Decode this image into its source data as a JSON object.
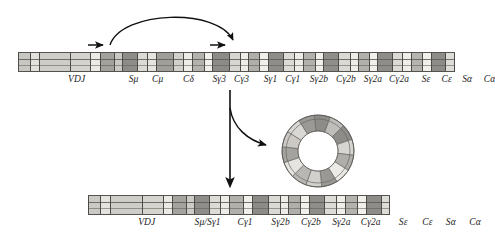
{
  "figure": {
    "background_color": "#ffffff",
    "line_color": "#111111"
  },
  "germline_locus": {
    "name": "germline-heavy-chain-locus",
    "bar": {
      "x": 18,
      "y": 52,
      "width": 437,
      "height": 20
    },
    "segments": [
      {
        "w": 13,
        "shade": "#c9c7c2"
      },
      {
        "w": 9,
        "shade": "#e3e1dc"
      },
      {
        "w": 36,
        "shade": "#cfcdc8"
      },
      {
        "w": 22,
        "shade": "#d5d3ce"
      },
      {
        "w": 10,
        "shade": "#eceae5"
      },
      {
        "w": 16,
        "shade": "#a3a19c"
      },
      {
        "w": 8,
        "shade": "#cbc9c4"
      },
      {
        "w": 16,
        "shade": "#8e8c88"
      },
      {
        "w": 11,
        "shade": "#dcdad5"
      },
      {
        "w": 10,
        "shade": "#e6e4df"
      },
      {
        "w": 18,
        "shade": "#a09e99"
      },
      {
        "w": 11,
        "shade": "#d2d0cb"
      },
      {
        "w": 9,
        "shade": "#eeece7"
      },
      {
        "w": 13,
        "shade": "#b4b2ad"
      },
      {
        "w": 8,
        "shade": "#f2f0eb"
      },
      {
        "w": 19,
        "shade": "#8d8b87"
      },
      {
        "w": 12,
        "shade": "#d8d6d1"
      },
      {
        "w": 8,
        "shade": "#efede8"
      },
      {
        "w": 12,
        "shade": "#b0aea9"
      },
      {
        "w": 9,
        "shade": "#f1efea"
      },
      {
        "w": 17,
        "shade": "#8f8d89"
      },
      {
        "w": 12,
        "shade": "#dddbd6"
      },
      {
        "w": 9,
        "shade": "#eeece7"
      },
      {
        "w": 13,
        "shade": "#b3b1ac"
      },
      {
        "w": 8,
        "shade": "#f1efea"
      },
      {
        "w": 17,
        "shade": "#908e8a"
      },
      {
        "w": 12,
        "shade": "#dbd9d4"
      },
      {
        "w": 9,
        "shade": "#efede8"
      },
      {
        "w": 12,
        "shade": "#b2b0ab"
      },
      {
        "w": 8,
        "shade": "#f2f0eb"
      },
      {
        "w": 16,
        "shade": "#8f8d89"
      },
      {
        "w": 11,
        "shade": "#dcdad5"
      },
      {
        "w": 9,
        "shade": "#f0eee9"
      },
      {
        "w": 12,
        "shade": "#b6b4af"
      },
      {
        "w": 9,
        "shade": "#f2f0eb"
      },
      {
        "w": 16,
        "shade": "#8e8c88"
      },
      {
        "w": 9,
        "shade": "#dedcd7"
      }
    ],
    "labels": [
      {
        "text": "VDJ",
        "x": 63,
        "name": "label-vdj"
      },
      {
        "text": "Sμ",
        "x": 124,
        "name": "label-s-mu"
      },
      {
        "text": "Cμ",
        "x": 150,
        "name": "label-c-mu"
      },
      {
        "text": "Cδ",
        "x": 183,
        "name": "label-c-delta"
      },
      {
        "text": "Sγ3",
        "x": 216,
        "name": "label-s-gamma3"
      },
      {
        "text": "Cγ3",
        "x": 240,
        "name": "label-c-gamma3"
      },
      {
        "text": "Sγ1",
        "x": 271,
        "name": "label-s-gamma1"
      },
      {
        "text": "Cγ1",
        "x": 295,
        "name": "label-c-gamma1"
      },
      {
        "text": "Sγ2b",
        "x": 323,
        "name": "label-s-gamma2b"
      },
      {
        "text": "Cγ2b",
        "x": 352,
        "name": "label-c-gamma2b"
      },
      {
        "text": "Sγ2a",
        "x": 381,
        "name": "label-s-gamma2a"
      },
      {
        "text": "Cγ2a",
        "x": 409,
        "name": "label-c-gamma2a"
      },
      {
        "text": "Sε",
        "x": 438,
        "name": "label-s-epsilon"
      },
      {
        "text": "Cε",
        "x": 460,
        "name": "label-c-epsilon"
      },
      {
        "text": "Sα",
        "x": 482,
        "name": "label-s-alpha"
      },
      {
        "text": "Cα",
        "x": 506,
        "name": "label-c-alpha"
      }
    ]
  },
  "switched_locus": {
    "name": "switched-heavy-chain-locus",
    "bar": {
      "x": 88,
      "y": 195,
      "width": 302,
      "height": 20
    },
    "segments": [
      {
        "w": 12,
        "shade": "#cbc9c4"
      },
      {
        "w": 9,
        "shade": "#e5e3de"
      },
      {
        "w": 34,
        "shade": "#cfcdc8"
      },
      {
        "w": 21,
        "shade": "#d6d4cf"
      },
      {
        "w": 9,
        "shade": "#eceae5"
      },
      {
        "w": 14,
        "shade": "#a5a39e"
      },
      {
        "w": 8,
        "shade": "#cdcbc6"
      },
      {
        "w": 15,
        "shade": "#8f8d89"
      },
      {
        "w": 10,
        "shade": "#dddbd6"
      },
      {
        "w": 9,
        "shade": "#eeece7"
      },
      {
        "w": 14,
        "shade": "#b2b0ab"
      },
      {
        "w": 8,
        "shade": "#f1efea"
      },
      {
        "w": 17,
        "shade": "#8d8b87"
      },
      {
        "w": 11,
        "shade": "#dbd9d4"
      },
      {
        "w": 8,
        "shade": "#efede8"
      },
      {
        "w": 12,
        "shade": "#b1afaa"
      },
      {
        "w": 8,
        "shade": "#f2f0eb"
      },
      {
        "w": 16,
        "shade": "#8f8d89"
      },
      {
        "w": 11,
        "shade": "#dedcd7"
      },
      {
        "w": 9,
        "shade": "#f0eee9"
      },
      {
        "w": 12,
        "shade": "#b5b3ae"
      },
      {
        "w": 8,
        "shade": "#f2f0eb"
      },
      {
        "w": 15,
        "shade": "#8e8c88"
      },
      {
        "w": 8,
        "shade": "#dedcd7"
      }
    ],
    "labels": [
      {
        "text": "VDJ",
        "x": 58,
        "name": "label-sw-vdj"
      },
      {
        "text": "Sμ/Sγ1",
        "x": 118,
        "name": "label-sw-s-mu-s-gamma1"
      },
      {
        "text": "Cγ1",
        "x": 155,
        "name": "label-sw-c-gamma1"
      },
      {
        "text": "Sγ2b",
        "x": 190,
        "name": "label-sw-s-gamma2b"
      },
      {
        "text": "Cγ2b",
        "x": 220,
        "name": "label-sw-c-gamma2b"
      },
      {
        "text": "Sγ2a",
        "x": 250,
        "name": "label-sw-s-gamma2a"
      },
      {
        "text": "Cγ2a",
        "x": 279,
        "name": "label-sw-c-gamma2a"
      },
      {
        "text": "Sε",
        "x": 311,
        "name": "label-sw-s-epsilon"
      },
      {
        "text": "Cε",
        "x": 335,
        "name": "label-sw-c-epsilon"
      },
      {
        "text": "Sα",
        "x": 358,
        "name": "label-sw-s-alpha"
      },
      {
        "text": "Cα",
        "x": 382,
        "name": "label-sw-c-alpha"
      }
    ]
  },
  "switch_circle": {
    "name": "excised-switch-circle",
    "center": {
      "x": 318,
      "y": 151
    },
    "outer_radius": 36,
    "inner_radius": 20,
    "segments": [
      {
        "shade": "#8e8c88"
      },
      {
        "shade": "#c0bebb"
      },
      {
        "shade": "#8e8c88"
      },
      {
        "shade": "#d7d5d1"
      },
      {
        "shade": "#b0aeaa"
      },
      {
        "shade": "#eceae6"
      },
      {
        "shade": "#9a9894"
      },
      {
        "shade": "#d2d0cc"
      },
      {
        "shade": "#b9b7b3"
      },
      {
        "shade": "#e6e4e0"
      },
      {
        "shade": "#a5a39f"
      },
      {
        "shade": "#ccc9c5"
      },
      {
        "shade": "#dad8d4"
      },
      {
        "shade": "#9b9995"
      }
    ]
  },
  "arrows": {
    "recombination_arc": {
      "name": "recombination-arc-arrow",
      "from_x": 110,
      "to_x": 234,
      "apex_y": 16,
      "base_y": 45
    },
    "tick_arrow_left": {
      "name": "switch-region-marker-left",
      "x": 100,
      "y": 45
    },
    "tick_arrow_right": {
      "name": "switch-region-marker-right",
      "x": 222,
      "y": 45
    },
    "main_down": {
      "name": "deletion-down-arrow",
      "x": 230,
      "y_from": 90,
      "y_to": 188
    },
    "branch_to_circle": {
      "name": "circle-excision-arrow",
      "x_from": 230,
      "y_from": 108,
      "x_to": 272,
      "y_to": 146
    }
  }
}
